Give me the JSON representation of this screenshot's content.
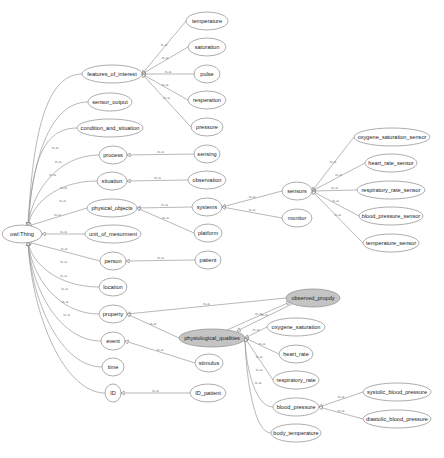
{
  "diagram": {
    "type": "ontology-class-hierarchy",
    "edge_label": "is-a",
    "colors": {
      "background": "#ffffff",
      "node_fill": "#ffffff",
      "node_stroke": "#8a8a8a",
      "highlight_fill": "#c4c4c4",
      "edge": "#9a9a9a",
      "text": "#222222"
    },
    "nodes": [
      {
        "id": "owl_thing",
        "label": "owl:Thing",
        "x": 22,
        "y": 234,
        "rx": 20,
        "ry": 9
      },
      {
        "id": "features_of_interest",
        "label": "features_of_interest",
        "x": 112,
        "y": 74,
        "rx": 30,
        "ry": 9
      },
      {
        "id": "sensor_output",
        "label": "sensor_output",
        "x": 110,
        "y": 102,
        "rx": 22,
        "ry": 9
      },
      {
        "id": "condition_and_situation",
        "label": "condition_and_situation",
        "x": 110,
        "y": 128,
        "rx": 33,
        "ry": 9
      },
      {
        "id": "process",
        "label": "process",
        "x": 113,
        "y": 155,
        "rx": 14,
        "ry": 9
      },
      {
        "id": "situation",
        "label": "situation",
        "x": 112,
        "y": 181,
        "rx": 15,
        "ry": 9
      },
      {
        "id": "physical_objects",
        "label": "physical_objects",
        "x": 112,
        "y": 208,
        "rx": 25,
        "ry": 9
      },
      {
        "id": "unit_of_mesurment",
        "label": "unit_of_mesurment",
        "x": 113,
        "y": 234,
        "rx": 28,
        "ry": 9
      },
      {
        "id": "person",
        "label": "person",
        "x": 113,
        "y": 261,
        "rx": 13,
        "ry": 9
      },
      {
        "id": "location",
        "label": "location",
        "x": 113,
        "y": 287,
        "rx": 14,
        "ry": 9
      },
      {
        "id": "property",
        "label": "property",
        "x": 113,
        "y": 314,
        "rx": 14,
        "ry": 9
      },
      {
        "id": "event",
        "label": "event",
        "x": 113,
        "y": 341,
        "rx": 12,
        "ry": 9
      },
      {
        "id": "time",
        "label": "time",
        "x": 113,
        "y": 367,
        "rx": 11,
        "ry": 9
      },
      {
        "id": "ID",
        "label": "ID",
        "x": 113,
        "y": 393,
        "rx": 8,
        "ry": 9
      },
      {
        "id": "temperature",
        "label": "temperature",
        "x": 207,
        "y": 21,
        "rx": 21,
        "ry": 9
      },
      {
        "id": "saturation",
        "label": "saturation",
        "x": 207,
        "y": 47,
        "rx": 19,
        "ry": 9
      },
      {
        "id": "pulse",
        "label": "pulse",
        "x": 207,
        "y": 74,
        "rx": 13,
        "ry": 9
      },
      {
        "id": "resperation",
        "label": "resperation",
        "x": 207,
        "y": 100,
        "rx": 19,
        "ry": 9
      },
      {
        "id": "pressure",
        "label": "pressure",
        "x": 207,
        "y": 127,
        "rx": 16,
        "ry": 9
      },
      {
        "id": "sensing",
        "label": "sensing",
        "x": 207,
        "y": 154,
        "rx": 13,
        "ry": 9
      },
      {
        "id": "observation",
        "label": "observation",
        "x": 207,
        "y": 180,
        "rx": 19,
        "ry": 9
      },
      {
        "id": "systems",
        "label": "systems",
        "x": 207,
        "y": 207,
        "rx": 15,
        "ry": 9
      },
      {
        "id": "platform",
        "label": "platform",
        "x": 208,
        "y": 233,
        "rx": 14,
        "ry": 9
      },
      {
        "id": "patient",
        "label": "patient",
        "x": 208,
        "y": 260,
        "rx": 13,
        "ry": 9
      },
      {
        "id": "sensors",
        "label": "sensors",
        "x": 297,
        "y": 191,
        "rx": 15,
        "ry": 9
      },
      {
        "id": "monitor",
        "label": "monitor",
        "x": 297,
        "y": 218,
        "rx": 15,
        "ry": 9
      },
      {
        "id": "oxygene_saturation_sensor",
        "label": "oxygene_saturation_sensor",
        "x": 392,
        "y": 137,
        "rx": 38,
        "ry": 9
      },
      {
        "id": "heart_rate_sensor",
        "label": "heart_rate_sensor",
        "x": 391,
        "y": 163,
        "rx": 26,
        "ry": 9
      },
      {
        "id": "respiratory_rate_sensor",
        "label": "respiratory_rate_sensor",
        "x": 391,
        "y": 190,
        "rx": 34,
        "ry": 9
      },
      {
        "id": "blood_pressure_sensor",
        "label": "blood_pressure_sensor",
        "x": 391,
        "y": 216,
        "rx": 32,
        "ry": 9
      },
      {
        "id": "temperature_sensor",
        "label": "temperature_sensor",
        "x": 391,
        "y": 243,
        "rx": 28,
        "ry": 9
      },
      {
        "id": "observed_propdy",
        "label": "observed_propdy",
        "x": 313,
        "y": 298,
        "rx": 27,
        "ry": 9,
        "highlight": true
      },
      {
        "id": "physiological_qualities",
        "label": "physiological_qualities",
        "x": 212,
        "y": 338,
        "rx": 33,
        "ry": 9,
        "highlight": true
      },
      {
        "id": "stimulus",
        "label": "stimulus",
        "x": 209,
        "y": 363,
        "rx": 14,
        "ry": 9
      },
      {
        "id": "ID_patient",
        "label": "ID_patient",
        "x": 208,
        "y": 393,
        "rx": 18,
        "ry": 9
      },
      {
        "id": "oxygene_saturation",
        "label": "oxygene_saturation",
        "x": 296,
        "y": 327,
        "rx": 29,
        "ry": 9
      },
      {
        "id": "heart_rate",
        "label": "heart_rate",
        "x": 296,
        "y": 354,
        "rx": 17,
        "ry": 9
      },
      {
        "id": "respiratory_rate",
        "label": "respiratory_rate",
        "x": 296,
        "y": 380,
        "rx": 23,
        "ry": 9
      },
      {
        "id": "blood_pressure",
        "label": "blood_pressure",
        "x": 296,
        "y": 407,
        "rx": 23,
        "ry": 9
      },
      {
        "id": "body_temperature",
        "label": "body_temperature",
        "x": 296,
        "y": 433,
        "rx": 25,
        "ry": 9
      },
      {
        "id": "systolic_blood_pressure",
        "label": "systolic_blood_pressure",
        "x": 397,
        "y": 392,
        "rx": 34,
        "ry": 9
      },
      {
        "id": "diastolic_blood_pressure",
        "label": "diastolic_blood_pressure",
        "x": 397,
        "y": 419,
        "rx": 34,
        "ry": 9
      }
    ],
    "edges": [
      {
        "child": "features_of_interest",
        "parent": "owl_thing"
      },
      {
        "child": "sensor_output",
        "parent": "owl_thing"
      },
      {
        "child": "condition_and_situation",
        "parent": "owl_thing"
      },
      {
        "child": "process",
        "parent": "owl_thing"
      },
      {
        "child": "situation",
        "parent": "owl_thing"
      },
      {
        "child": "physical_objects",
        "parent": "owl_thing"
      },
      {
        "child": "unit_of_mesurment",
        "parent": "owl_thing"
      },
      {
        "child": "person",
        "parent": "owl_thing"
      },
      {
        "child": "location",
        "parent": "owl_thing"
      },
      {
        "child": "property",
        "parent": "owl_thing"
      },
      {
        "child": "event",
        "parent": "owl_thing"
      },
      {
        "child": "time",
        "parent": "owl_thing"
      },
      {
        "child": "ID",
        "parent": "owl_thing"
      },
      {
        "child": "temperature",
        "parent": "features_of_interest"
      },
      {
        "child": "saturation",
        "parent": "features_of_interest"
      },
      {
        "child": "pulse",
        "parent": "features_of_interest"
      },
      {
        "child": "resperation",
        "parent": "features_of_interest"
      },
      {
        "child": "pressure",
        "parent": "features_of_interest"
      },
      {
        "child": "sensing",
        "parent": "process"
      },
      {
        "child": "observation",
        "parent": "situation"
      },
      {
        "child": "systems",
        "parent": "physical_objects"
      },
      {
        "child": "platform",
        "parent": "physical_objects"
      },
      {
        "child": "patient",
        "parent": "person"
      },
      {
        "child": "sensors",
        "parent": "systems"
      },
      {
        "child": "monitor",
        "parent": "systems"
      },
      {
        "child": "oxygene_saturation_sensor",
        "parent": "sensors"
      },
      {
        "child": "heart_rate_sensor",
        "parent": "sensors"
      },
      {
        "child": "respiratory_rate_sensor",
        "parent": "sensors"
      },
      {
        "child": "blood_pressure_sensor",
        "parent": "sensors"
      },
      {
        "child": "temperature_sensor",
        "parent": "sensors"
      },
      {
        "child": "observed_propdy",
        "parent": "property"
      },
      {
        "child": "physiological_qualities",
        "parent": "property"
      },
      {
        "child": "physiological_qualities",
        "parent": "observed_propdy"
      },
      {
        "child": "observed_propdy",
        "parent": "physiological_qualities"
      },
      {
        "child": "stimulus",
        "parent": "event"
      },
      {
        "child": "ID_patient",
        "parent": "ID"
      },
      {
        "child": "oxygene_saturation",
        "parent": "physiological_qualities"
      },
      {
        "child": "heart_rate",
        "parent": "physiological_qualities"
      },
      {
        "child": "respiratory_rate",
        "parent": "physiological_qualities"
      },
      {
        "child": "blood_pressure",
        "parent": "physiological_qualities"
      },
      {
        "child": "body_temperature",
        "parent": "physiological_qualities"
      },
      {
        "child": "systolic_blood_pressure",
        "parent": "blood_pressure"
      },
      {
        "child": "diastolic_blood_pressure",
        "parent": "blood_pressure"
      }
    ]
  }
}
